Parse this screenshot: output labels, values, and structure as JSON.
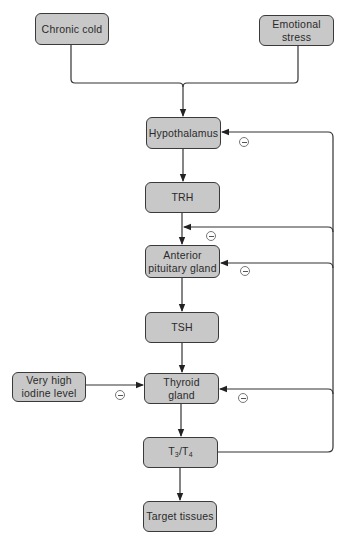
{
  "diagram": {
    "type": "flowchart",
    "topic": "Regulation of thyroid hormone secretion",
    "colors": {
      "box_fill": "#c8c8c8",
      "box_border": "#3a3a3a",
      "line": "#333333",
      "background": "#ffffff"
    },
    "nodes": {
      "chronic_cold": {
        "label": "Chronic cold"
      },
      "emotional_stress": {
        "label_line1": "Emotional",
        "label_line2": "stress"
      },
      "hypothalamus": {
        "label": "Hypothalamus"
      },
      "trh": {
        "label": "TRH"
      },
      "anterior_pituitary": {
        "label_line1": "Anterior",
        "label_line2": "pituitary gland"
      },
      "tsh": {
        "label": "TSH"
      },
      "very_high_iodine": {
        "label_line1": "Very high",
        "label_line2": "iodine level"
      },
      "thyroid": {
        "label_line1": "Thyroid",
        "label_line2": "gland"
      },
      "t3t4": {
        "label_t": "T",
        "sub3": "3",
        "slash": "/T",
        "sub4": "4"
      },
      "target_tissues": {
        "label": "Target tissues"
      }
    },
    "edges": [
      {
        "from": "Chronic cold",
        "to": "Hypothalamus",
        "type": "stimulate"
      },
      {
        "from": "Emotional stress",
        "to": "Hypothalamus",
        "type": "stimulate"
      },
      {
        "from": "Hypothalamus",
        "to": "TRH",
        "type": "stimulate"
      },
      {
        "from": "TRH",
        "to": "Anterior pituitary gland",
        "type": "stimulate"
      },
      {
        "from": "Anterior pituitary gland",
        "to": "TSH",
        "type": "stimulate"
      },
      {
        "from": "TSH",
        "to": "Thyroid gland",
        "type": "stimulate"
      },
      {
        "from": "Very high iodine level",
        "to": "Thyroid gland",
        "type": "inhibit",
        "sign": "−"
      },
      {
        "from": "Thyroid gland",
        "to": "T3/T4",
        "type": "stimulate"
      },
      {
        "from": "T3/T4",
        "to": "Target tissues",
        "type": "stimulate"
      },
      {
        "from": "T3/T4",
        "to": "Hypothalamus",
        "type": "inhibit",
        "sign": "−"
      },
      {
        "from": "T3/T4",
        "to": "TRH",
        "type": "inhibit",
        "sign": "−"
      },
      {
        "from": "T3/T4",
        "to": "Anterior pituitary gland",
        "type": "inhibit",
        "sign": "−"
      },
      {
        "from": "T3/T4",
        "to": "Thyroid gland",
        "type": "inhibit",
        "sign": "−"
      }
    ]
  }
}
